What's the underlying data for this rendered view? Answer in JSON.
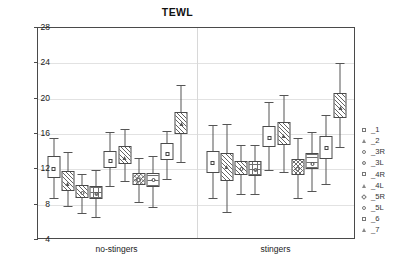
{
  "chart_data": {
    "type": "box",
    "title": "TEWL",
    "xlabel": "",
    "ylabel": "",
    "ylim": [
      4,
      28
    ],
    "yticks": [
      4,
      8,
      12,
      16,
      20,
      24,
      28
    ],
    "grid": true,
    "legend_position": "right",
    "categories": [
      "no-stingers",
      "stingers"
    ],
    "legend": [
      "_1",
      "_2",
      "_3R",
      "_3L",
      "_4R",
      "_4L",
      "_5R",
      "_5L",
      "_6",
      "_7"
    ],
    "markers": [
      "square",
      "triangle",
      "circle",
      "circledot",
      "square",
      "triangle",
      "diamond",
      "circle",
      "square",
      "triangle"
    ],
    "fills": [
      "plain",
      "diag",
      "diag",
      "grid",
      "plain",
      "diag",
      "cross",
      "horiz",
      "plain",
      "diag"
    ],
    "series": [
      {
        "name": "no-stingers",
        "boxes": [
          {
            "label": "_1",
            "mean": 12.2,
            "box_low": 11.0,
            "box_high": 13.5,
            "whisker_low": 8.8,
            "whisker_high": 15.5
          },
          {
            "label": "_2",
            "mean": 10.5,
            "box_low": 9.6,
            "box_high": 11.8,
            "whisker_low": 7.9,
            "whisker_high": 14.0
          },
          {
            "label": "_3R",
            "mean": 9.4,
            "box_low": 8.7,
            "box_high": 10.2,
            "whisker_low": 7.1,
            "whisker_high": 11.5
          },
          {
            "label": "_3L",
            "mean": 9.3,
            "box_low": 8.6,
            "box_high": 10.1,
            "whisker_low": 6.6,
            "whisker_high": 11.9
          },
          {
            "label": "_4R",
            "mean": 13.1,
            "box_low": 12.2,
            "box_high": 14.1,
            "whisker_low": 10.1,
            "whisker_high": 16.2
          },
          {
            "label": "_4L",
            "mean": 13.4,
            "box_low": 12.6,
            "box_high": 14.6,
            "whisker_low": 10.7,
            "whisker_high": 16.6
          },
          {
            "label": "_5R",
            "mean": 10.9,
            "box_low": 10.2,
            "box_high": 11.6,
            "whisker_low": 8.3,
            "whisker_high": 13.3
          },
          {
            "label": "_5L",
            "mean": 10.9,
            "box_low": 10.0,
            "box_high": 11.6,
            "whisker_low": 7.7,
            "whisker_high": 13.5
          },
          {
            "label": "_6",
            "mean": 13.9,
            "box_low": 13.1,
            "box_high": 15.0,
            "whisker_low": 10.9,
            "whisker_high": 16.3
          },
          {
            "label": "_7",
            "mean": 17.2,
            "box_low": 16.0,
            "box_high": 18.5,
            "whisker_low": 12.8,
            "whisker_high": 21.5
          }
        ]
      },
      {
        "name": "stingers",
        "boxes": [
          {
            "label": "_1",
            "mean": 12.8,
            "box_low": 11.6,
            "box_high": 14.1,
            "whisker_low": 8.8,
            "whisker_high": 17.0
          },
          {
            "label": "_2",
            "mean": 12.4,
            "box_low": 10.7,
            "box_high": 13.8,
            "whisker_low": 7.2,
            "whisker_high": 17.1
          },
          {
            "label": "_3R",
            "mean": 12.2,
            "box_low": 11.4,
            "box_high": 12.9,
            "whisker_low": 9.2,
            "whisker_high": 14.8
          },
          {
            "label": "_3L",
            "mean": 12.0,
            "box_low": 11.3,
            "box_high": 13.0,
            "whisker_low": 9.2,
            "whisker_high": 14.8
          },
          {
            "label": "_4R",
            "mean": 15.7,
            "box_low": 14.5,
            "box_high": 16.9,
            "whisker_low": 11.9,
            "whisker_high": 19.6
          },
          {
            "label": "_4L",
            "mean": 15.9,
            "box_low": 14.8,
            "box_high": 17.4,
            "whisker_low": 11.7,
            "whisker_high": 20.4
          },
          {
            "label": "_5R",
            "mean": 12.1,
            "box_low": 11.4,
            "box_high": 13.2,
            "whisker_low": 8.8,
            "whisker_high": 15.6
          },
          {
            "label": "_5L",
            "mean": 12.7,
            "box_low": 12.0,
            "box_high": 13.9,
            "whisker_low": 9.5,
            "whisker_high": 16.2
          },
          {
            "label": "_6",
            "mean": 14.5,
            "box_low": 13.2,
            "box_high": 15.8,
            "whisker_low": 10.3,
            "whisker_high": 18.2
          },
          {
            "label": "_7",
            "mean": 19.0,
            "box_low": 17.8,
            "box_high": 20.6,
            "whisker_low": 14.5,
            "whisker_high": 24.0
          }
        ]
      }
    ]
  }
}
